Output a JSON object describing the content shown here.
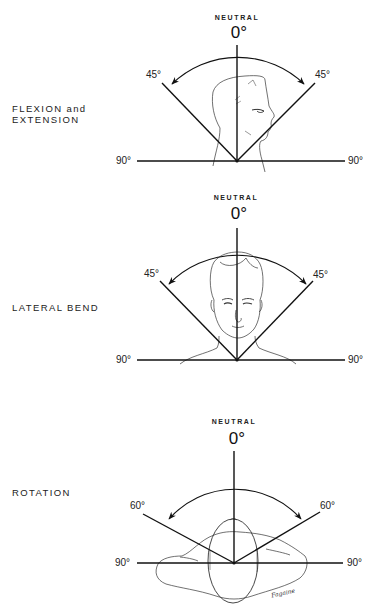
{
  "figure": {
    "panels": [
      {
        "id": "flexion-extension",
        "label_lines": [
          "FLEXION and",
          "EXTENSION"
        ],
        "neutral_label": "NEUTRAL",
        "zero_label": "0°",
        "left_angle_label": "45°",
        "right_angle_label": "45°",
        "left_horizontal_label": "90°",
        "right_horizontal_label": "90°",
        "range_degrees": 45,
        "illustration": "head-profile"
      },
      {
        "id": "lateral-bend",
        "label_lines": [
          "LATERAL BEND"
        ],
        "neutral_label": "NEUTRAL",
        "zero_label": "0°",
        "left_angle_label": "45°",
        "right_angle_label": "45°",
        "left_horizontal_label": "90°",
        "right_horizontal_label": "90°",
        "range_degrees": 45,
        "illustration": "head-frontal"
      },
      {
        "id": "rotation",
        "label_lines": [
          "ROTATION"
        ],
        "neutral_label": "NEUTRAL",
        "zero_label": "0°",
        "left_angle_label": "60°",
        "right_angle_label": "60°",
        "left_horizontal_label": "90°",
        "right_horizontal_label": "90°",
        "range_degrees": 60,
        "illustration": "head-top-view",
        "signature": "Fagaine"
      }
    ]
  },
  "colors": {
    "line": "#111111",
    "background": "#ffffff"
  }
}
